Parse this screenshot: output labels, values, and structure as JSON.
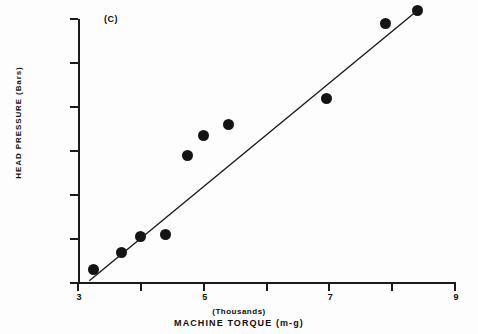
{
  "chart_data": {
    "type": "scatter",
    "title": "",
    "panel_label": "(C)",
    "xlabel": "MACHINE TORQUE (m-g)",
    "xlabel_units": "(Thousands)",
    "ylabel": "HEAD PRESSURE (Bars)",
    "xlim": [
      3,
      9
    ],
    "ylim": [
      40,
      168
    ],
    "grid": false,
    "legend": null,
    "x_ticks": [
      3,
      4,
      5,
      6,
      7,
      8,
      9
    ],
    "x_tick_labels": [
      "3",
      "",
      "5",
      "",
      "7",
      "",
      "9"
    ],
    "y_ticks": [
      40,
      60,
      80,
      100,
      120,
      140,
      160
    ],
    "y_tick_labels": [
      "40",
      "60",
      "80",
      "100",
      "120",
      "140",
      "160"
    ],
    "marker_color": "#141414",
    "line_color": "#1a1a1a",
    "points": [
      {
        "x": 3.25,
        "y": 46
      },
      {
        "x": 3.7,
        "y": 54
      },
      {
        "x": 4.0,
        "y": 61
      },
      {
        "x": 4.4,
        "y": 62
      },
      {
        "x": 4.75,
        "y": 98
      },
      {
        "x": 5.0,
        "y": 107
      },
      {
        "x": 5.4,
        "y": 112
      },
      {
        "x": 6.95,
        "y": 124
      },
      {
        "x": 7.9,
        "y": 158
      },
      {
        "x": 8.4,
        "y": 164
      }
    ],
    "fit_line": {
      "type": "linear-regression",
      "x_start": 3.18,
      "y_start": 41,
      "x_end": 8.45,
      "y_end": 165
    }
  }
}
